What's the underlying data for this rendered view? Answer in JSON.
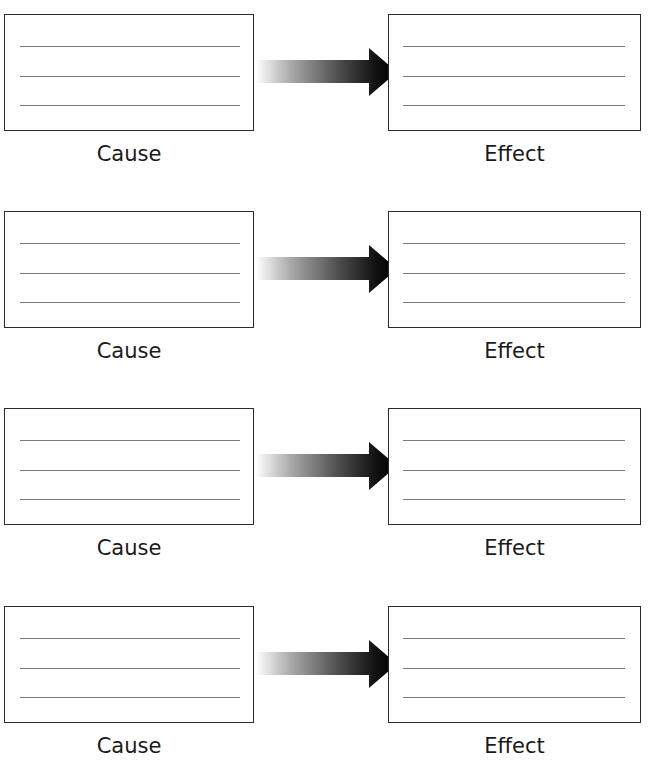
{
  "diagram": {
    "type": "cause-effect organizer",
    "rows": [
      {
        "cause_label": "Cause",
        "effect_label": "Effect",
        "cause_lines": 3,
        "effect_lines": 3
      },
      {
        "cause_label": "Cause",
        "effect_label": "Effect",
        "cause_lines": 3,
        "effect_lines": 3
      },
      {
        "cause_label": "Cause",
        "effect_label": "Effect",
        "cause_lines": 3,
        "effect_lines": 3
      },
      {
        "cause_label": "Cause",
        "effect_label": "Effect",
        "cause_lines": 3,
        "effect_lines": 3
      }
    ],
    "arrow_icon": "gradient-right-arrow",
    "colors": {
      "border": "#2a2a2a",
      "writing_line": "#7a7a7a",
      "arrow_start": "#ffffff",
      "arrow_end": "#000000"
    }
  }
}
